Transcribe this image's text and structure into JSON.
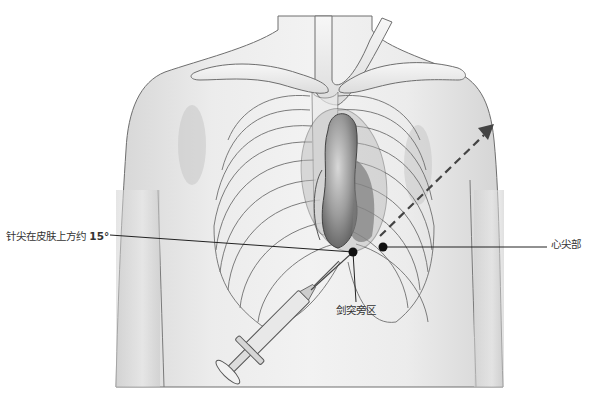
{
  "figure": {
    "background_color": "#ffffff",
    "body_fill": "#e4e4e4",
    "outline_color": "#6e6e6e",
    "heart_fill": "#9a9a9a",
    "pointer_color": "#111111"
  },
  "labels": {
    "needle_angle": {
      "text": "针尖在皮肤上方约 ",
      "value": "15°"
    },
    "apex": {
      "text": "心尖部"
    },
    "subxiphoid": {
      "text": "剑突旁区"
    }
  },
  "icons": {
    "direction_arrow": "dashed-arrow-toward-left-shoulder",
    "syringe": "syringe",
    "puncture_point": "black-dot"
  }
}
